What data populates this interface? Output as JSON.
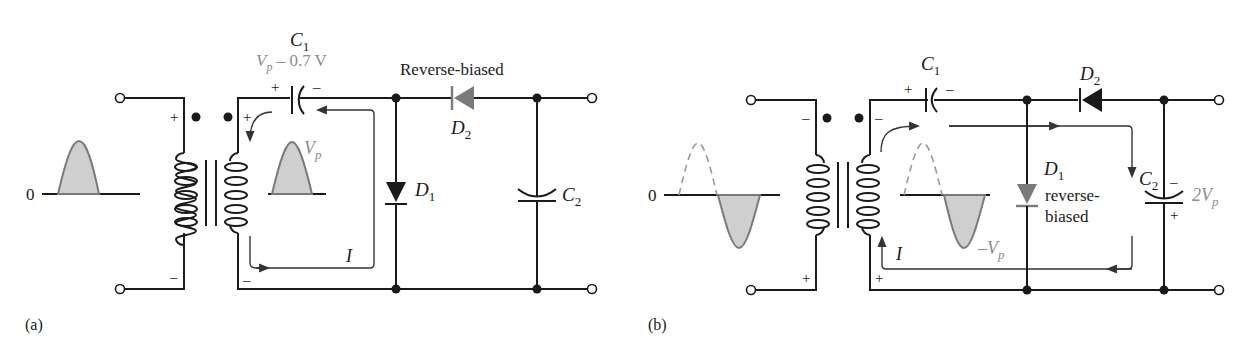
{
  "figure_a": {
    "label": "(a)",
    "zero": "0",
    "c1": {
      "name": "C",
      "sub": "1",
      "voltage_v": "V",
      "voltage_sub": "p",
      "voltage_rest": " – 0.7 V",
      "plus": "+",
      "minus": "–"
    },
    "d2": {
      "name": "D",
      "sub": "2",
      "state": "Reverse-biased"
    },
    "d1": {
      "name": "D",
      "sub": "1"
    },
    "c2": {
      "name": "C",
      "sub": "2"
    },
    "vp": {
      "v": "V",
      "sub": "p"
    },
    "current": "I",
    "primary_plus": "+",
    "primary_minus": "–",
    "secondary_plus": "+",
    "secondary_minus": "–"
  },
  "figure_b": {
    "label": "(b)",
    "zero": "0",
    "c1": {
      "name": "C",
      "sub": "1",
      "plus": "+",
      "minus": "–"
    },
    "d2": {
      "name": "D",
      "sub": "2"
    },
    "d1": {
      "name": "D",
      "sub": "1",
      "state_line1": "reverse-",
      "state_line2": "biased"
    },
    "c2": {
      "name": "C",
      "sub": "2",
      "voltage_v": "2V",
      "voltage_sub": "p",
      "plus": "+",
      "minus": "–"
    },
    "neg_vp": {
      "v": "–V",
      "sub": "p"
    },
    "current": "I",
    "primary_plus": "+",
    "primary_minus": "–",
    "secondary_plus": "+",
    "secondary_minus": "–"
  },
  "colors": {
    "wire": "#1a1a1a",
    "highlight_gray": "#8c8c8c",
    "wave_fill": "#cfcfcf"
  }
}
